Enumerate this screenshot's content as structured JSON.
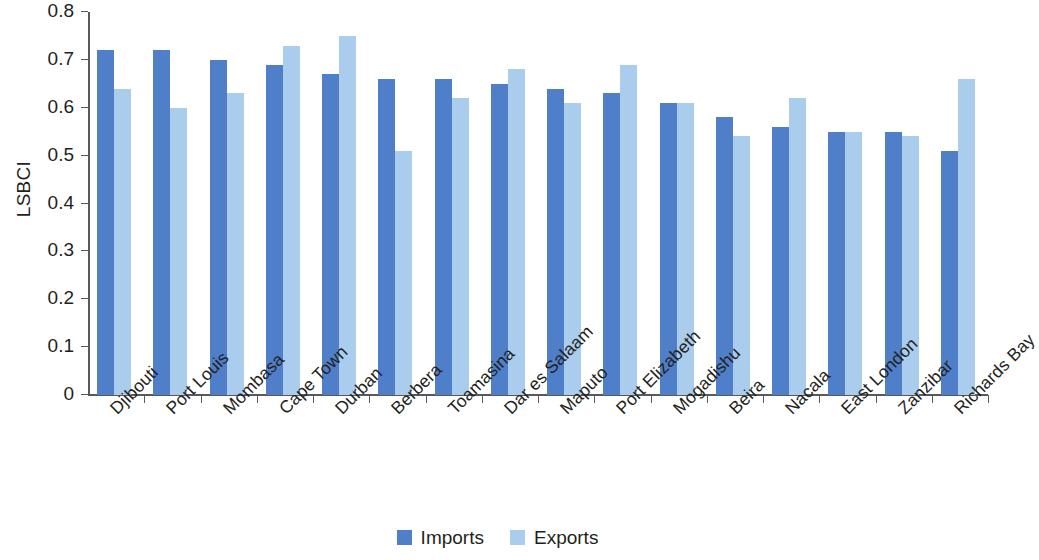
{
  "chart_data": {
    "type": "bar",
    "title": "",
    "subtitle": "",
    "xlabel": "",
    "ylabel": "LSBCI",
    "ylim": [
      0,
      0.8
    ],
    "ytick_labels": [
      "0.8",
      "0.7",
      "0.6",
      "0.5",
      "0.4",
      "0.3",
      "0.2",
      "0.1",
      "0"
    ],
    "ytick_values": [
      0.8,
      0.7,
      0.6,
      0.5,
      0.4,
      0.3,
      0.2,
      0.1,
      0
    ],
    "grid": false,
    "legend_position": "bottom-center",
    "categories": [
      "Djibouti",
      "Port Louis",
      "Mombasa",
      "Cape Town",
      "Durban",
      "Berbera",
      "Toamasina",
      "Dar es Salaam",
      "Maputo",
      "Port Elizabeth",
      "Mogadishu",
      "Beira",
      "Nacala",
      "East London",
      "Zanzibar",
      "Richards Bay"
    ],
    "series": [
      {
        "name": "Imports",
        "color": "#4f7fc9",
        "values": [
          0.72,
          0.72,
          0.7,
          0.69,
          0.67,
          0.66,
          0.66,
          0.65,
          0.64,
          0.63,
          0.61,
          0.58,
          0.56,
          0.55,
          0.55,
          0.51
        ]
      },
      {
        "name": "Exports",
        "color": "#aacdee",
        "values": [
          0.64,
          0.6,
          0.63,
          0.73,
          0.75,
          0.51,
          0.62,
          0.68,
          0.61,
          0.69,
          0.61,
          0.54,
          0.62,
          0.55,
          0.54,
          0.66
        ]
      }
    ]
  },
  "legend": {
    "items": [
      {
        "label": "Imports",
        "color": "#4f7fc9"
      },
      {
        "label": "Exports",
        "color": "#aacdee"
      }
    ]
  },
  "axis": {
    "y_title": "LSBCI"
  }
}
